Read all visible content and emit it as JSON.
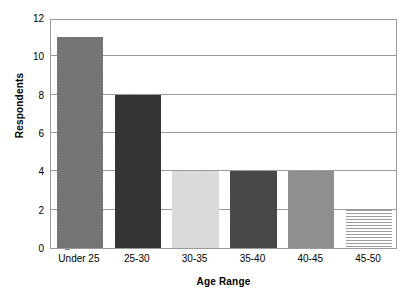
{
  "chart_data": {
    "type": "bar",
    "title": "",
    "xlabel": "Age Range",
    "ylabel": "Respondents",
    "categories": [
      "Under 25",
      "25-30",
      "30-35",
      "35-40",
      "40-45",
      "45-50"
    ],
    "values": [
      11,
      8,
      4,
      4,
      4,
      2
    ],
    "series": [
      {
        "name": "Respondents",
        "values": [
          11,
          8,
          4,
          4,
          4,
          2
        ]
      }
    ],
    "ylim": [
      0,
      12
    ],
    "yticks": [
      0,
      2,
      4,
      6,
      8,
      10,
      12
    ],
    "ytick_labels": [
      "0",
      "2",
      "4",
      "6",
      "8",
      "10",
      "12"
    ],
    "grid": "horizontal",
    "legend": "none",
    "bar_styles": [
      {
        "category": "Under 25",
        "pattern": "checker-mid",
        "color": "#7b7b7b"
      },
      {
        "category": "25-30",
        "pattern": "solid-darkest",
        "color": "#373737"
      },
      {
        "category": "30-35",
        "pattern": "lightest",
        "color": "#dedede"
      },
      {
        "category": "35-40",
        "pattern": "dark",
        "color": "#4b4b4b"
      },
      {
        "category": "40-45",
        "pattern": "medium",
        "color": "#929292"
      },
      {
        "category": "45-50",
        "pattern": "horizontal-lines",
        "color": "#ffffff"
      }
    ],
    "colors": {
      "plot_background": "#ffffff",
      "frame": "#9a9a9a",
      "gridline": "#9a9a9a",
      "text": "#000000"
    }
  }
}
